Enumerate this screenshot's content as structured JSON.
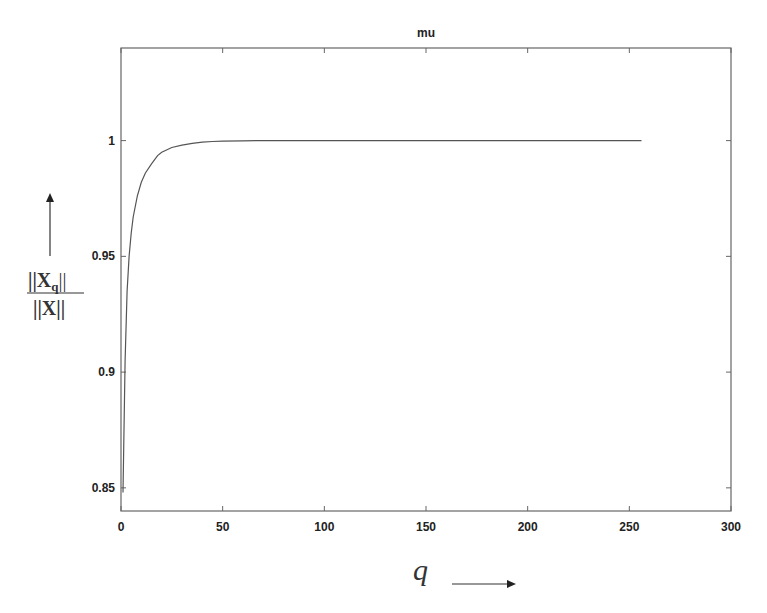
{
  "chart_data": {
    "type": "line",
    "title": "mu",
    "xlabel": "q",
    "ylabel": "||X_q|| / ||X||",
    "ylabel_parts": {
      "numerator": "||X",
      "numerator_sub": "q",
      "numerator_end": "||",
      "denominator": "||X||"
    },
    "xlim": [
      0,
      300
    ],
    "ylim": [
      0.84,
      1.04
    ],
    "xticks": [
      0,
      50,
      100,
      150,
      200,
      250,
      300
    ],
    "xtick_labels": [
      "0",
      "50",
      "100",
      "150",
      "200",
      "250",
      "300"
    ],
    "yticks": [
      0.85,
      0.9,
      0.95,
      1
    ],
    "ytick_labels": [
      "0.85",
      "0.9",
      "0.95",
      "1"
    ],
    "grid": false,
    "legend": null,
    "series": [
      {
        "name": "mu",
        "color": "#555555",
        "x": [
          1,
          2,
          3,
          4,
          5,
          6,
          8,
          10,
          12,
          15,
          18,
          20,
          25,
          30,
          35,
          40,
          45,
          50,
          60,
          70,
          80,
          100,
          150,
          200,
          256
        ],
        "y": [
          0.848,
          0.905,
          0.935,
          0.95,
          0.96,
          0.967,
          0.976,
          0.982,
          0.986,
          0.99,
          0.9935,
          0.995,
          0.997,
          0.998,
          0.9988,
          0.9993,
          0.9996,
          0.9998,
          0.9999,
          1.0,
          1.0,
          1.0,
          1.0,
          1.0,
          1.0
        ]
      }
    ]
  },
  "axis_arrows": {
    "x": "→",
    "y": "↑"
  }
}
